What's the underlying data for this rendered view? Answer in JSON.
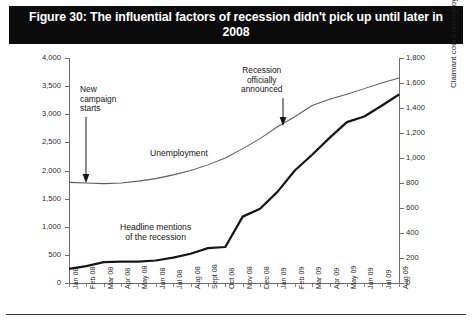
{
  "title": "Figure 30: The influential factors of recession didn't pick up until later in 2008",
  "axis": {
    "left_title": "UK headlines mentioning recession",
    "right_title": "Claimant count unemployments (000s)",
    "left_ticks": [
      "0",
      "500",
      "1,000",
      "1,500",
      "2,000",
      "2,500",
      "3,000",
      "3,500",
      "4,000"
    ],
    "right_ticks": [
      "0",
      "200",
      "400",
      "600",
      "800",
      "1,000",
      "1,200",
      "1,400",
      "1,600",
      "1,800"
    ]
  },
  "annotations": {
    "campaign": "New\ncampaign\nstarts",
    "recession": "Recession\nofficially\nannounced"
  },
  "series_labels": {
    "unemployment": "Unemployment",
    "headlines": "Headline mentions\nof the recession"
  },
  "chart_data": {
    "type": "line",
    "title": "Figure 30: The influential factors of recession didn't pick up until later in 2008",
    "xlabel": "",
    "ylabel": "UK headlines mentioning recession",
    "y2label": "Claimant count unemployments (000s)",
    "ylim": [
      0,
      4000
    ],
    "y2lim": [
      0,
      1800
    ],
    "grid": false,
    "legend": "inline-labels",
    "categories": [
      "Jan 08",
      "Feb 08",
      "Mar 08",
      "Apr 08",
      "May 08",
      "Jun 08",
      "Jul 08",
      "Aug 08",
      "Sept 08",
      "Oct 08",
      "Nov 08",
      "Dec 08",
      "Jan 09",
      "Feb 09",
      "Mar 09",
      "Apr 09",
      "May 09",
      "Jun 09",
      "Jul 09",
      "Aug 09"
    ],
    "series": [
      {
        "name": "Headline mentions of the recession",
        "axis": "left",
        "style": "thick-dark",
        "values": [
          250,
          300,
          370,
          380,
          380,
          400,
          450,
          520,
          620,
          640,
          1180,
          1320,
          1620,
          2000,
          2280,
          2580,
          2860,
          2960,
          3150,
          3350
        ]
      },
      {
        "name": "Unemployment",
        "axis": "right",
        "style": "thin-grey",
        "values": [
          805,
          800,
          795,
          800,
          815,
          835,
          865,
          900,
          945,
          1000,
          1075,
          1155,
          1250,
          1330,
          1420,
          1470,
          1510,
          1555,
          1600,
          1640
        ]
      }
    ],
    "annotations": [
      {
        "text": "New campaign starts",
        "at_category": "Jan 08",
        "arrow": "down"
      },
      {
        "text": "Recession officially announced",
        "at_category": "Jan 09",
        "arrow": "down"
      }
    ]
  }
}
